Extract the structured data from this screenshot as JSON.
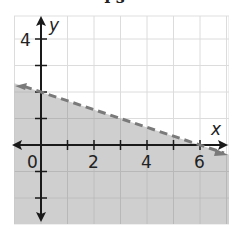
{
  "header": {
    "title_fragment": "l      s"
  },
  "chart_data": {
    "type": "line",
    "title": "",
    "xlabel": "x",
    "ylabel": "y",
    "xlim": [
      -1,
      7
    ],
    "ylim": [
      -3,
      5
    ],
    "grid": true,
    "x_tick_labels": [
      "0",
      "2",
      "4",
      "6"
    ],
    "y_tick_labels": [
      "4"
    ],
    "series": [
      {
        "name": "boundary",
        "style": "dashed",
        "color": "#7a7a7a",
        "x": [
          -1,
          0,
          6,
          7
        ],
        "y": [
          2.333,
          2,
          0,
          -0.333
        ],
        "equation": "y = -x/3 + 2"
      }
    ],
    "shaded_region": {
      "side": "below",
      "color": "#cfcfcf",
      "inequality": "y < -x/3 + 2"
    },
    "annotations": [
      "Dashed boundary line through (0, 2) and (6, 0); region below shaded"
    ]
  },
  "colors": {
    "shade": "#cfcfcf",
    "grid_light": "#dcdcdc",
    "grid_dark": "#b8b8b8",
    "axis": "#1a1a1a",
    "dashed": "#7a7a7a"
  }
}
